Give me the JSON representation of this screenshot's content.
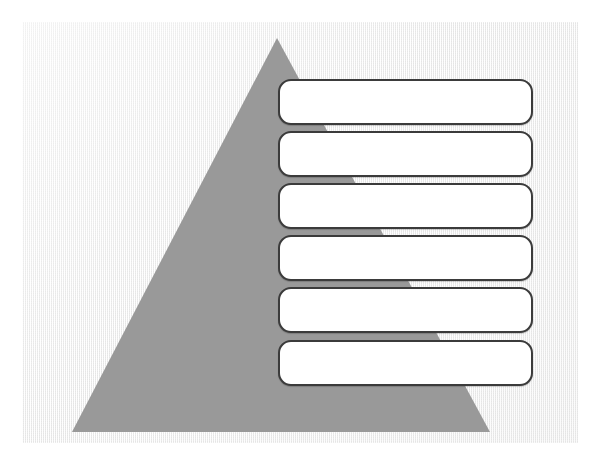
{
  "slide": {
    "title": "",
    "canvas": {
      "background_color": "#f2f2f2",
      "left": 22,
      "top": 22,
      "width": 556,
      "height": 421
    }
  },
  "diagram": {
    "type": "pyramid",
    "name": "blank-pyramid-diagram",
    "shape": {
      "name": "triangle",
      "fill_color": "#999999",
      "apex": {
        "x": 277,
        "y": 38
      },
      "bottom_left": {
        "x": 72,
        "y": 432
      },
      "bottom_right": {
        "x": 490,
        "y": 432
      }
    },
    "levels": 6,
    "text_boxes": [
      {
        "index": 1,
        "label": "",
        "placeholder": "",
        "fill_color": "#ffffff",
        "border_color": "#3b3b3b"
      },
      {
        "index": 2,
        "label": "",
        "placeholder": "",
        "fill_color": "#ffffff",
        "border_color": "#3b3b3b"
      },
      {
        "index": 3,
        "label": "",
        "placeholder": "",
        "fill_color": "#ffffff",
        "border_color": "#3b3b3b"
      },
      {
        "index": 4,
        "label": "",
        "placeholder": "",
        "fill_color": "#ffffff",
        "border_color": "#3b3b3b"
      },
      {
        "index": 5,
        "label": "",
        "placeholder": "",
        "fill_color": "#ffffff",
        "border_color": "#3b3b3b"
      },
      {
        "index": 6,
        "label": "",
        "placeholder": "",
        "fill_color": "#ffffff",
        "border_color": "#3b3b3b"
      }
    ]
  }
}
